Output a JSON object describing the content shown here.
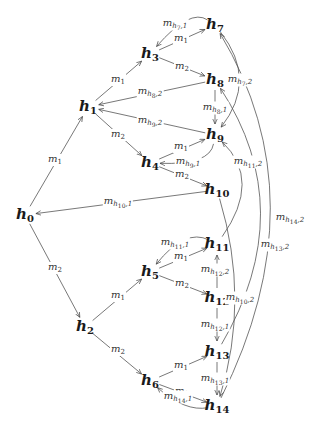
{
  "diagram": {
    "nodes": [
      {
        "id": "h0",
        "base": "h",
        "sub": "0",
        "x": 25,
        "y": 215
      },
      {
        "id": "h1",
        "base": "h",
        "sub": "1",
        "x": 88,
        "y": 107
      },
      {
        "id": "h2",
        "base": "h",
        "sub": "2",
        "x": 85,
        "y": 327
      },
      {
        "id": "h3",
        "base": "h",
        "sub": "3",
        "x": 150,
        "y": 54
      },
      {
        "id": "h4",
        "base": "h",
        "sub": "4",
        "x": 150,
        "y": 163
      },
      {
        "id": "h5",
        "base": "h",
        "sub": "5",
        "x": 150,
        "y": 272
      },
      {
        "id": "h6",
        "base": "h",
        "sub": "6",
        "x": 150,
        "y": 381
      },
      {
        "id": "h7",
        "base": "h",
        "sub": "7",
        "x": 215,
        "y": 25
      },
      {
        "id": "h8",
        "base": "h",
        "sub": "8",
        "x": 215,
        "y": 80
      },
      {
        "id": "h9",
        "base": "h",
        "sub": "9",
        "x": 215,
        "y": 135
      },
      {
        "id": "h10",
        "base": "h",
        "sub": "10",
        "x": 217,
        "y": 190
      },
      {
        "id": "h11",
        "base": "h",
        "sub": "11",
        "x": 217,
        "y": 244
      },
      {
        "id": "h12",
        "base": "h",
        "sub": "12",
        "x": 217,
        "y": 298
      },
      {
        "id": "h13",
        "base": "h",
        "sub": "13",
        "x": 217,
        "y": 352
      },
      {
        "id": "h14",
        "base": "h",
        "sub": "14",
        "x": 217,
        "y": 406
      }
    ],
    "edges": [
      {
        "from": "h0",
        "to": "h1",
        "label": "m1",
        "lx": 55,
        "ly": 160
      },
      {
        "from": "h0",
        "to": "h2",
        "label": "m2",
        "lx": 55,
        "ly": 268
      },
      {
        "from": "h1",
        "to": "h3",
        "label": "m1",
        "lx": 118,
        "ly": 80
      },
      {
        "from": "h1",
        "to": "h4",
        "label": "m2",
        "lx": 118,
        "ly": 135
      },
      {
        "from": "h2",
        "to": "h5",
        "label": "m1",
        "lx": 118,
        "ly": 296
      },
      {
        "from": "h2",
        "to": "h6",
        "label": "m2",
        "lx": 118,
        "ly": 350
      },
      {
        "from": "h3",
        "to": "h7",
        "label": "m1",
        "lx": 181,
        "ly": 39
      },
      {
        "from": "h3",
        "to": "h8",
        "label": "m2",
        "lx": 182,
        "ly": 67
      },
      {
        "from": "h4",
        "to": "h9",
        "label": "m1",
        "lx": 181,
        "ly": 147
      },
      {
        "from": "h4",
        "to": "h10",
        "label": "m2",
        "lx": 182,
        "ly": 175
      },
      {
        "from": "h5",
        "to": "h11",
        "label": "m1",
        "lx": 181,
        "ly": 257
      },
      {
        "from": "h5",
        "to": "h12",
        "label": "m2",
        "lx": 182,
        "ly": 284
      },
      {
        "from": "h6",
        "to": "h13",
        "label": "m1",
        "lx": 181,
        "ly": 366
      },
      {
        "from": "h6",
        "to": "h14",
        "label": "m2",
        "lx": 182,
        "ly": 392
      },
      {
        "from": "h7",
        "to": "h3",
        "label": "m_{h7,1}",
        "lx": 175,
        "ly": 24
      },
      {
        "from": "h7",
        "to": "h9",
        "label": "m_{h7,2}",
        "lx": 240,
        "ly": 80
      },
      {
        "from": "h8",
        "to": "h1",
        "label": "m_{h8,2}",
        "lx": 150,
        "ly": 92
      },
      {
        "from": "h8",
        "to": "h9",
        "label": "m_{h8,1}",
        "lx": 215,
        "ly": 108
      },
      {
        "from": "h9",
        "to": "h1",
        "label": "m_{h9,2}",
        "lx": 150,
        "ly": 121
      },
      {
        "from": "h9",
        "to": "h4",
        "label": "m_{h9,1}",
        "lx": 188,
        "ly": 162
      },
      {
        "from": "h10",
        "to": "h0",
        "label": "m_{h10,1}",
        "lx": 118,
        "ly": 202
      },
      {
        "from": "h10",
        "to": "h14",
        "label": "m_{h10,2}",
        "lx": 240,
        "ly": 298
      },
      {
        "from": "h11",
        "to": "h5",
        "label": "m_{h11,1}",
        "lx": 175,
        "ly": 243
      },
      {
        "from": "h11",
        "to": "h9",
        "label": "m_{h11,2}",
        "lx": 248,
        "ly": 162
      },
      {
        "from": "h12",
        "to": "h11",
        "label": "m_{h12,2}",
        "lx": 215,
        "ly": 270
      },
      {
        "from": "h12",
        "to": "h13",
        "label": "m_{h12,1}",
        "lx": 215,
        "ly": 325
      },
      {
        "from": "h13",
        "to": "h8",
        "label": "m_{h13,2}",
        "lx": 275,
        "ly": 245
      },
      {
        "from": "h13",
        "to": "h14",
        "label": "m_{h13,1}",
        "lx": 215,
        "ly": 379
      },
      {
        "from": "h14",
        "to": "h6",
        "label": "m_{h14,1}",
        "lx": 178,
        "ly": 397
      },
      {
        "from": "h14",
        "to": "h7",
        "label": "m_{h14,2}",
        "lx": 290,
        "ly": 218
      }
    ]
  }
}
